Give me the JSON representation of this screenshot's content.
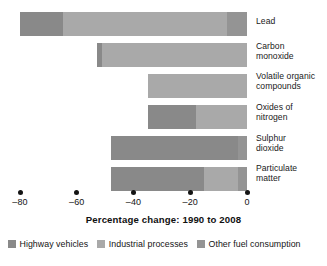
{
  "chart_data": {
    "type": "bar",
    "orientation": "horizontal",
    "stacked": true,
    "title": "",
    "xlabel": "Percentage change: 1990 to 2008",
    "ylabel": "",
    "xlim": [
      -88,
      4
    ],
    "xticks": [
      -80,
      -60,
      -40,
      -20,
      0
    ],
    "xtick_labels": [
      "–80",
      "–60",
      "–40",
      "–20",
      "0"
    ],
    "grid": false,
    "legend_position": "bottom-left",
    "categories": [
      "Lead",
      "Carbon monoxide",
      "Volatile organic compounds",
      "Oxides of nitrogen",
      "Sulphur dioxide",
      "Particulate matter"
    ],
    "category_label_lines": [
      [
        "Lead"
      ],
      [
        "Carbon",
        "monoxide"
      ],
      [
        "Volatile organic",
        "compounds"
      ],
      [
        "Oxides of",
        "nitrogen"
      ],
      [
        "Sulphur",
        "dioxide"
      ],
      [
        "Particulate",
        "matter"
      ]
    ],
    "series": [
      {
        "name": "Highway vehicles",
        "color": "#898989",
        "values": [
          -15,
          -2,
          0,
          -17,
          -45,
          -33
        ]
      },
      {
        "name": "Industrial processes",
        "color": "#a9a9a9",
        "values": [
          -58,
          -51,
          -35,
          -18,
          0,
          -12
        ]
      },
      {
        "name": "Other fuel consumption",
        "color": "#949494",
        "values": [
          -7,
          0,
          0,
          0,
          -3,
          -3
        ]
      }
    ],
    "totals": [
      -80,
      -53,
      -35,
      -35,
      -48,
      -48
    ],
    "bar_starts": [
      -80,
      -53,
      -35,
      -35,
      -48,
      -48
    ],
    "bar_end": 0
  },
  "legend": {
    "items": [
      {
        "label": "Highway vehicles",
        "color": "#898989"
      },
      {
        "label": "Industrial processes",
        "color": "#a9a9a9"
      },
      {
        "label": "Other fuel consumption",
        "color": "#949494"
      }
    ]
  }
}
